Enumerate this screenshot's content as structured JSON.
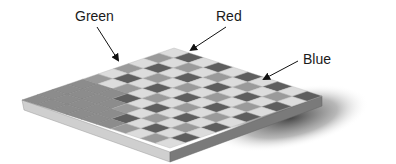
{
  "figure": {
    "labels": [
      {
        "id": "green",
        "text": "Green",
        "x": 75,
        "y": 9
      },
      {
        "id": "red",
        "text": "Red",
        "x": 216,
        "y": 9
      },
      {
        "id": "blue",
        "text": "Blue",
        "x": 303,
        "y": 52
      }
    ],
    "arrows": [
      {
        "id": "green-arrow",
        "from": [
          97,
          27
        ],
        "to": [
          118,
          60
        ]
      },
      {
        "id": "red-arrow",
        "from": [
          226,
          27
        ],
        "to": [
          191,
          50
        ]
      },
      {
        "id": "blue-arrow",
        "from": [
          298,
          61
        ],
        "to": [
          264,
          79
        ]
      }
    ],
    "colors": {
      "background": "#ffffff",
      "text": "#1a1a1a",
      "tile_light": "#dcdcdc",
      "tile_mid": "#9a9a9a",
      "tile_dark": "#5e5e5e",
      "base_top": "#8c8c8c",
      "base_side_left": "#cfcfcf",
      "base_side_right": "#7a7a7a",
      "shadow": "#404040"
    }
  }
}
